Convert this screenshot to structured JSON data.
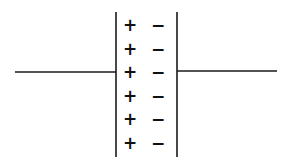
{
  "diagram": {
    "type": "parallel-plate capacitor with separated charges",
    "left_plate": {
      "charge_symbol": "+",
      "count": 6
    },
    "right_plate": {
      "charge_symbol": "−",
      "count": 6
    },
    "colors": {
      "line": "#1a1a1a",
      "background": "#ffffff"
    }
  }
}
